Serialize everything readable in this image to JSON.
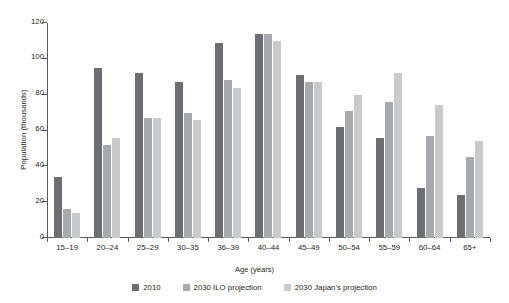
{
  "chart_data": {
    "type": "bar",
    "title": "",
    "xlabel": "Age (years)",
    "ylabel": "Population (thousands)",
    "ylim": [
      0,
      120
    ],
    "yticks": [
      0,
      20,
      40,
      60,
      80,
      100,
      120
    ],
    "grid": false,
    "legend_position": "bottom",
    "categories": [
      "15–19",
      "20–24",
      "25–29",
      "30–35",
      "36–39",
      "40–44",
      "45–49",
      "50–54",
      "55–59",
      "60–64",
      "65+"
    ],
    "series": [
      {
        "name": "2010",
        "color": "#6d6e71",
        "values": [
          34,
          95,
          92,
          87,
          109,
          114,
          91,
          62,
          56,
          28,
          24
        ]
      },
      {
        "name": "2030 ILO projection",
        "color": "#a7a9ac",
        "values": [
          16,
          52,
          67,
          70,
          88,
          114,
          87,
          71,
          76,
          57,
          45
        ]
      },
      {
        "name": "2030 Japan's projection",
        "color": "#c9cacb",
        "values": [
          14,
          56,
          67,
          66,
          84,
          110,
          87,
          80,
          92,
          74,
          54
        ]
      }
    ]
  }
}
